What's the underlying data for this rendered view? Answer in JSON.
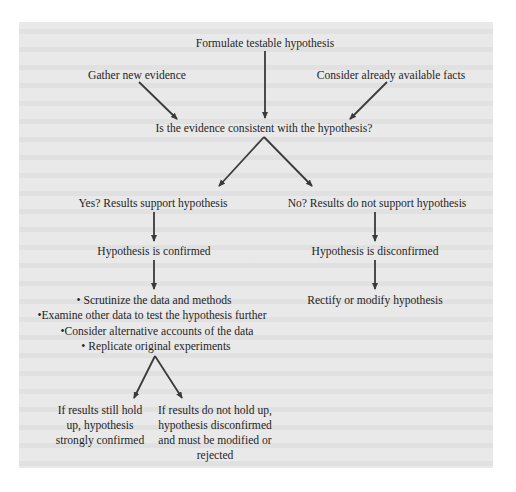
{
  "diagram": {
    "title_node": "Formulate testable hypothesis",
    "left_input": "Gather new evidence",
    "right_input": "Consider already available facts",
    "question": "Is the evidence consistent with the hypothesis?",
    "yes_branch": {
      "result": "Yes? Results support hypothesis",
      "outcome": "Hypothesis is confirmed",
      "actions": [
        "Scrutinize the data and methods",
        "Examine other data to test the hypothesis further",
        "Consider alternative accounts of the data",
        "Replicate original experiments"
      ],
      "bullet": "•",
      "final_left": "If results still hold up, hypothesis strongly confirmed",
      "final_right": "If results do not hold up, hypothesis disconfirmed and must be modified or rejected"
    },
    "no_branch": {
      "result": "No? Results do not support hypothesis",
      "outcome": "Hypothesis is disconfirmed",
      "action": "Rectify or modify hypothesis"
    }
  },
  "colors": {
    "panel_background": "#e9e9e9",
    "page_background": "#ffffff",
    "text": "#1f1f1f",
    "arrow": "#3a3a3a"
  }
}
